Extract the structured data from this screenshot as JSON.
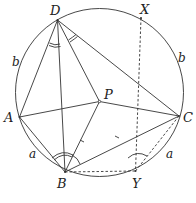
{
  "diagram": {
    "type": "geometry",
    "colors": {
      "stroke": "#333333",
      "background": "#ffffff"
    },
    "circle": {
      "cx": 99.5,
      "cy": 92.5,
      "r": 84
    },
    "points": {
      "A": {
        "label": "A",
        "x": 19.5,
        "y": 117
      },
      "B": {
        "label": "B",
        "x": 65,
        "y": 172
      },
      "C": {
        "label": "C",
        "x": 179,
        "y": 116
      },
      "D": {
        "label": "D",
        "x": 57.5,
        "y": 20
      },
      "P": {
        "label": "P",
        "x": 99.5,
        "y": 101.5
      },
      "X": {
        "label": "X",
        "x": 141,
        "y": 18
      },
      "Y": {
        "label": "Y",
        "x": 135.5,
        "y": 171
      }
    },
    "arc_labels": {
      "b_left": "b",
      "b_right": "b",
      "a_left": "a",
      "a_right": "a"
    },
    "solid_segments": [
      "DA",
      "DB",
      "DP",
      "DC",
      "AP",
      "AB",
      "PC",
      "BP",
      "BC"
    ],
    "dashed_segments": [
      "XY",
      "BY",
      "YC"
    ],
    "tick_marks": [
      "BP",
      "PY"
    ],
    "angle_marks": [
      {
        "vertex": "D",
        "between": [
          "A",
          "B"
        ],
        "style": "double-arc"
      },
      {
        "vertex": "D",
        "between": [
          "P",
          "C"
        ],
        "style": "double-arc"
      },
      {
        "vertex": "B",
        "between": [
          "A",
          "P"
        ],
        "style": "double-arc"
      },
      {
        "vertex": "B",
        "between": [
          "P",
          "C"
        ],
        "style": "single-arc"
      },
      {
        "vertex": "Y",
        "between": [
          "P",
          "C"
        ],
        "style": "single-arc"
      }
    ]
  }
}
